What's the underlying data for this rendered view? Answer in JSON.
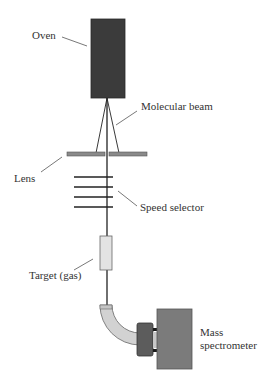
{
  "header": {
    "cut_off_text": "· · · · · · · ·   ·  · · · ·  ·  · · · · · · ·  · · · · · ·  · ·"
  },
  "diagram": {
    "components": [
      {
        "id": "oven",
        "label": "Oven"
      },
      {
        "id": "molecular-beam",
        "label": "Molecular beam"
      },
      {
        "id": "lens",
        "label": "Lens"
      },
      {
        "id": "speed-selector",
        "label": "Speed selector"
      },
      {
        "id": "target",
        "label": "Target (gas)"
      },
      {
        "id": "mass-spectrometer",
        "label_line1": "Mass",
        "label_line2": "spectrometer"
      }
    ],
    "colors": {
      "oven": "#3a3a3a",
      "lens": "#8a8a8a",
      "target": "#e2e2e2",
      "tube": "#d0d0d0",
      "coupler": "#5a5a5a",
      "mass_spectrometer": "#7a7a7a",
      "line": "#222222"
    }
  }
}
